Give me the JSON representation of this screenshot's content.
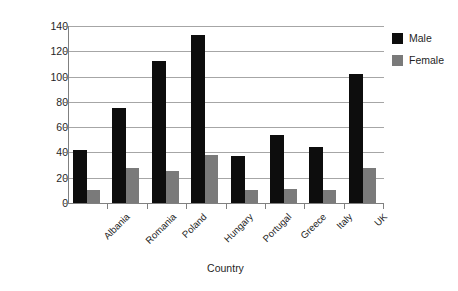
{
  "chart_data": {
    "type": "bar",
    "title": "",
    "xlabel": "Country",
    "ylabel": "CHD mortality rate per 100 000 age standardised",
    "categories": [
      "Albania",
      "Romania",
      "Poland",
      "Hungary",
      "Portugal",
      "Greece",
      "Italy",
      "UK"
    ],
    "series": [
      {
        "name": "Male",
        "color": "#0d0d0d",
        "values": [
          42,
          75,
          112,
          133,
          37,
          54,
          44,
          102
        ]
      },
      {
        "name": "Female",
        "color": "#7a7a7a",
        "values": [
          10,
          28,
          25,
          38,
          10,
          11,
          10,
          28
        ]
      }
    ],
    "ylim": [
      0,
      140
    ],
    "yticks": [
      0,
      20,
      40,
      60,
      80,
      100,
      120,
      140
    ],
    "ytick_labels": [
      "0",
      "20",
      "40",
      "60",
      "80",
      "100",
      "120",
      "140"
    ],
    "grid": true,
    "legend_position": "right"
  },
  "legend": {
    "items": [
      {
        "label": "Male"
      },
      {
        "label": "Female"
      }
    ]
  }
}
